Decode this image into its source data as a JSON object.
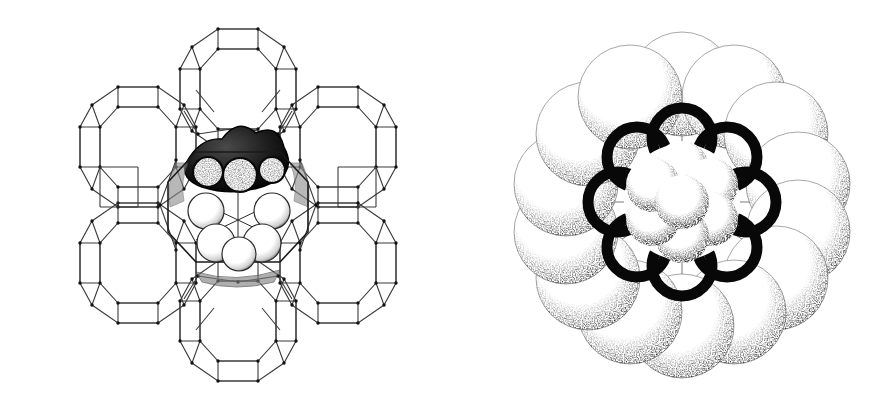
{
  "figure": {
    "background_color": "#ffffff",
    "ink_color": "#111111",
    "line_color": "#3a3a3a",
    "width": 892,
    "height": 411,
    "panel_count": 2
  },
  "panels": [
    {
      "id": "A",
      "label": "A",
      "kind": "wireframe-framework-with-guest",
      "description": "Zeolite faujasite framework drawn as an open wire polyhedral cage network with a space-filling guest cluster occupying the central supercage",
      "framework": {
        "style": "wireframe",
        "vertex_marker": "dot",
        "line_color": "#3a3a3a",
        "line_width": 1.1,
        "vertex_color": "#111111",
        "vertex_radius": 1.6,
        "cage_count": 7,
        "cage_type": "truncated-octahedron",
        "center": {
          "x": 238,
          "y": 205
        },
        "cage_radius": 62,
        "ring_radius": 116,
        "ring_cage_count": 6
      },
      "guest": {
        "style": "space-filling",
        "center": {
          "x": 238,
          "y": 207
        },
        "radius": 66,
        "dark_lobe_count": 4,
        "light_sphere_count": 5,
        "dark_fill": "#101010",
        "light_fill": "#fbfbfb",
        "stipple": true
      }
    },
    {
      "id": "B",
      "label": "B",
      "kind": "space-filling-rosette",
      "description": "CPK space-filling model viewed down the ring axis: an outer ring of large stippled spheres encircling a heavily outlined inner rosette of smaller spheres",
      "outer_ring": {
        "sphere_count": 14,
        "ring_radius": 118,
        "sphere_radius": 52,
        "fill": "#ffffff",
        "edge_stipple_color": "#111111",
        "outline_width": 1.0,
        "center": {
          "x": 236,
          "y": 202
        }
      },
      "mid_ring": {
        "sphere_count": 8,
        "ring_radius": 62,
        "sphere_radius": 30,
        "outline_color": "#0b0b0b",
        "outline_width": 9,
        "fill": "#ffffff"
      },
      "inner_cluster": {
        "sphere_count": 7,
        "ring_radius": 34,
        "sphere_radius": 26,
        "fill": "#ffffff",
        "stipple": true
      }
    }
  ],
  "labels": {
    "panel_a": "A",
    "panel_b": "B"
  }
}
